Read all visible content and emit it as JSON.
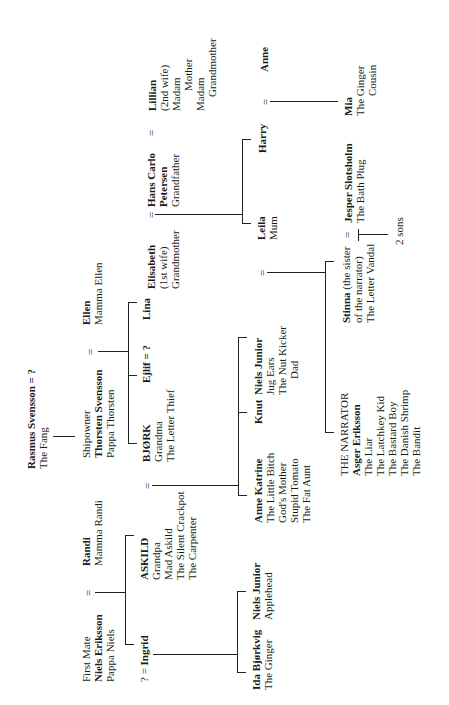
{
  "nodes": {
    "rasmus": {
      "name": "Rasmus Svensson = ?",
      "lines": [
        "The Fang"
      ]
    },
    "thorsten": {
      "pre": "Shipowner",
      "name": "Thorsten Svensson",
      "lines": [
        "Pappa Thorsten"
      ]
    },
    "ellen": {
      "name": "Ellen",
      "lines": [
        "Mamma Ellen"
      ]
    },
    "bjork": {
      "name": "BJØRK",
      "lines": [
        "Grandma",
        "The Letter Thief"
      ]
    },
    "ejlif": {
      "name": "Ejlif = ?"
    },
    "lina": {
      "name": "Lina"
    },
    "niels_eriksson": {
      "pre": "First Mate",
      "name": "Niels Eriksson",
      "lines": [
        "Pappa Niels"
      ]
    },
    "randi": {
      "name": "Randi",
      "lines": [
        "Mamma Randi"
      ]
    },
    "askild": {
      "name": "ASKILD",
      "lines": [
        "Grandpa",
        "Mad Askild",
        "The Silent Crackpot",
        "The Carpenter"
      ]
    },
    "ingrid": {
      "pre": "? = ",
      "name": "Ingrid"
    },
    "ida": {
      "name": "Ida Bjørkvig",
      "lines": [
        "The Ginger"
      ]
    },
    "niels_junior_apple": {
      "name": "Niels Junior",
      "lines": [
        "Applehead"
      ]
    },
    "anne_katrine": {
      "name": "Anne Katrine",
      "lines": [
        "The Little Bitch",
        "God's Mother",
        "Stupid Tomato",
        "The Fat Aunt"
      ]
    },
    "knut": {
      "name": "Knut"
    },
    "niels_junior": {
      "name": "Niels Junior",
      "lines": [
        "Jug Ears",
        "The Nut Kicker",
        "Dad"
      ]
    },
    "elisabeth": {
      "name": "Elisabeth",
      "lines": [
        "(1st wife)",
        "Grandmother"
      ]
    },
    "hans": {
      "name": "Hans Carlo",
      "name2": "Petersen",
      "lines": [
        "Grandfather"
      ]
    },
    "lillian": {
      "name": "Lillian",
      "lines": [
        "(2nd wife)",
        "Madam",
        "Mother",
        "Madam",
        "Grandmother"
      ]
    },
    "leila": {
      "name": "Leila",
      "lines": [
        "Mum"
      ]
    },
    "harry": {
      "name": "Harry"
    },
    "anne": {
      "name": "Anne"
    },
    "narrator": {
      "name": "THE NARRATOR",
      "name2": "Asger Eriksson",
      "lines": [
        "The Liar",
        "The Latchkey Kid",
        "The Bastard Boy",
        "The Danish Shrimp",
        "The Bandit"
      ]
    },
    "stinna": {
      "name": "Stinna",
      "lines": [
        " (the sister",
        "of the narrator)",
        "The Letter Vandal"
      ]
    },
    "jesper": {
      "name": "Jesper Slotsholm",
      "lines": [
        "The Bath Plug"
      ]
    },
    "two_sons": {
      "name": "2 sons"
    },
    "mia": {
      "name": "Mia",
      "lines": [
        "The Ginger",
        "Cousin"
      ]
    }
  },
  "symbols": {
    "marriage": "="
  }
}
